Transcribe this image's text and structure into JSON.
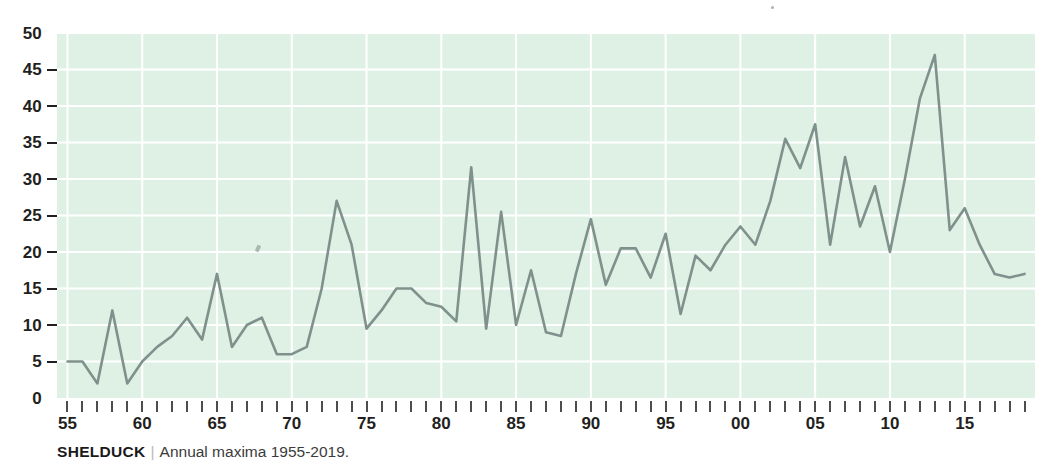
{
  "caption": {
    "species": "SHELDUCK",
    "separator": "|",
    "description": "Annual maxima 1955-2019."
  },
  "colors": {
    "plot_background": "#dff0e4",
    "gridline": "#ffffff",
    "series_line": "#7f918c",
    "axis_text": "#231f20",
    "tick_mark": "#4d4d4d"
  },
  "chart_data": {
    "type": "line",
    "title": "SHELDUCK",
    "subtitle": "Annual maxima 1955-2019.",
    "xlabel": "",
    "ylabel": "",
    "xlim": [
      1954.3,
      2019.7
    ],
    "ylim": [
      0,
      50
    ],
    "grid": true,
    "legend": "none",
    "y_ticks": [
      0,
      5,
      10,
      15,
      20,
      25,
      30,
      35,
      40,
      45,
      50
    ],
    "y_tick_labels": [
      "0",
      "5",
      "10",
      "15",
      "20",
      "25",
      "30",
      "35",
      "40",
      "45",
      "50"
    ],
    "x_tick_years": [
      1955,
      1956,
      1957,
      1958,
      1959,
      1960,
      1961,
      1962,
      1963,
      1964,
      1965,
      1966,
      1967,
      1968,
      1969,
      1970,
      1971,
      1972,
      1973,
      1974,
      1975,
      1976,
      1977,
      1978,
      1979,
      1980,
      1981,
      1982,
      1983,
      1984,
      1985,
      1986,
      1987,
      1988,
      1989,
      1990,
      1991,
      1992,
      1993,
      1994,
      1995,
      1996,
      1997,
      1998,
      1999,
      2000,
      2001,
      2002,
      2003,
      2004,
      2005,
      2006,
      2007,
      2008,
      2009,
      2010,
      2011,
      2012,
      2013,
      2014,
      2015,
      2016,
      2017,
      2018,
      2019
    ],
    "x_labeled_years": [
      1955,
      1960,
      1965,
      1970,
      1975,
      1980,
      1985,
      1990,
      1995,
      2000,
      2005,
      2010,
      2015
    ],
    "x_tick_labels": [
      "55",
      "60",
      "65",
      "70",
      "75",
      "80",
      "85",
      "90",
      "95",
      "00",
      "05",
      "10",
      "15"
    ],
    "series": [
      {
        "name": "Shelduck annual maxima",
        "x": [
          1955,
          1956,
          1957,
          1958,
          1959,
          1960,
          1961,
          1962,
          1963,
          1964,
          1965,
          1966,
          1967,
          1968,
          1969,
          1970,
          1971,
          1972,
          1973,
          1974,
          1975,
          1976,
          1977,
          1978,
          1979,
          1980,
          1981,
          1982,
          1983,
          1984,
          1985,
          1986,
          1987,
          1988,
          1989,
          1990,
          1991,
          1992,
          1993,
          1994,
          1995,
          1996,
          1997,
          1998,
          1999,
          2000,
          2001,
          2002,
          2003,
          2004,
          2005,
          2006,
          2007,
          2008,
          2009,
          2010,
          2011,
          2012,
          2013,
          2014,
          2015,
          2016,
          2017,
          2018,
          2019
        ],
        "values": [
          5,
          5,
          2,
          12,
          2,
          5,
          7,
          8.5,
          11,
          8,
          17,
          7,
          10,
          11,
          6,
          6,
          7,
          15,
          27,
          21,
          9.5,
          12,
          15,
          15,
          13,
          12.5,
          10.5,
          31.6,
          9.5,
          25.5,
          10,
          17.5,
          9,
          8.5,
          17,
          24.5,
          15.5,
          20.5,
          20.5,
          16.5,
          22.5,
          11.5,
          19.5,
          17.5,
          21,
          23.5,
          21,
          27,
          35.5,
          31.5,
          37.5,
          21,
          33,
          23.5,
          29,
          20,
          30,
          41,
          47,
          23,
          26,
          21,
          17,
          16.5,
          17
        ]
      }
    ]
  }
}
